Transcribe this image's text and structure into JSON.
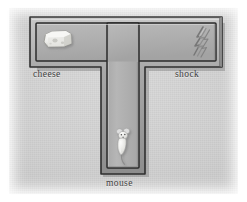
{
  "figure": {
    "type": "t-maze",
    "background_color": "#cfcfcf",
    "frame_color": "#ffffff",
    "wall_color": "#9a9a9a",
    "wall_edge_color": "#3a3a3a",
    "floor_color": "#b4b4b4",
    "label_color": "#3b3b3b"
  },
  "labels": {
    "cheese": "cheese",
    "shock": "shock",
    "mouse": "mouse"
  },
  "objects": [
    {
      "name": "cheese",
      "icon": "cheese-wedge-icon",
      "label": "cheese",
      "arm": "left-arm",
      "color": "#efefe7"
    },
    {
      "name": "shock",
      "icon": "lightning-bolt-icon",
      "label": "shock",
      "arm": "right-arm",
      "color": "#d6d6d6"
    },
    {
      "name": "mouse",
      "icon": "mouse-icon",
      "label": "mouse",
      "arm": "stem",
      "color": "#e8e8e4"
    }
  ],
  "maze": {
    "arms": [
      "left-arm",
      "right-arm",
      "stem"
    ],
    "shape": "T"
  }
}
